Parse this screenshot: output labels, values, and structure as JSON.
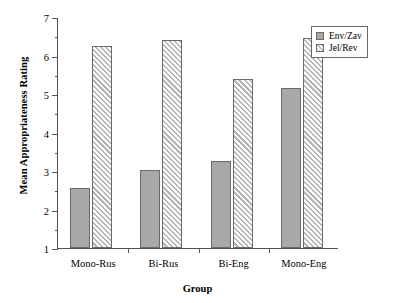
{
  "chart_data": {
    "type": "bar",
    "title": "",
    "xlabel": "Group",
    "ylabel": "Mean Appropriateness Rating",
    "categories": [
      "Mono-Rus",
      "Bi-Rus",
      "Bi-Eng",
      "Mono-Eng"
    ],
    "series": [
      {
        "name": "Env/Zav",
        "values": [
          2.55,
          3.03,
          3.27,
          5.15
        ],
        "color": "#a8a8a8",
        "fill": "solid"
      },
      {
        "name": "Jel/Rev",
        "values": [
          6.25,
          6.4,
          5.4,
          6.45
        ],
        "color": "#b4b4b4",
        "fill": "hatched-45deg"
      }
    ],
    "ylim": [
      1,
      7
    ],
    "yticks": [
      1,
      2,
      3,
      4,
      5,
      6,
      7
    ],
    "ytick_labels": [
      "1",
      "2",
      "3",
      "4",
      "5",
      "6",
      "7"
    ],
    "yminor_ticks": [
      1.5,
      2.5,
      3.5,
      4.5,
      5.5,
      6.5
    ],
    "grid": false,
    "legend_position": "top-right",
    "legend_entries": [
      "Env/Zav",
      "Jel/Rev"
    ]
  },
  "axes": {
    "y_title": "Mean Appropriateness Rating",
    "x_title": "Group"
  },
  "legend": {
    "items": [
      {
        "label": "Env/Zav",
        "swatch": "solid-gray-swatch"
      },
      {
        "label": "Jel/Rev",
        "swatch": "hatched-gray-swatch"
      }
    ]
  }
}
